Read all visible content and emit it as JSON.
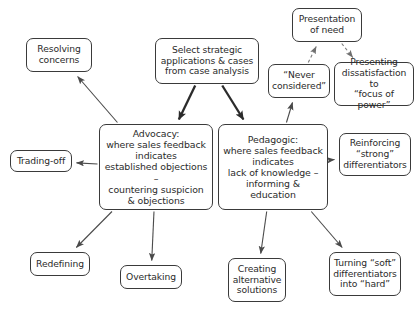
{
  "diagram": {
    "style": {
      "background": "#ffffff",
      "node_border": "#3a3a3a",
      "text_color": "#2b2b2b",
      "edge_solid": "#4a4a4a",
      "edge_thick": "#2b2b2b",
      "edge_dashed": "#7d7d7d"
    },
    "nodes": [
      {
        "id": "resolving",
        "label": "Resolving\nconcerns",
        "x": 26,
        "y": 38,
        "w": 66,
        "h": 34,
        "size": "n-small"
      },
      {
        "id": "select",
        "label": "Select strategic\napplications & cases\nfrom case analysis",
        "x": 155,
        "y": 38,
        "w": 104,
        "h": 46,
        "size": "n-mid"
      },
      {
        "id": "presentation",
        "label": "Presentation\nof need",
        "x": 292,
        "y": 8,
        "w": 70,
        "h": 34,
        "size": "n-small"
      },
      {
        "id": "never",
        "label": "“Never\nconsidered”",
        "x": 268,
        "y": 64,
        "w": 62,
        "h": 34,
        "size": "n-small"
      },
      {
        "id": "presenting",
        "label": "Presenting\ndissatisfaction to\n“focus of power”",
        "x": 334,
        "y": 62,
        "w": 80,
        "h": 44,
        "size": "n-small"
      },
      {
        "id": "advocacy",
        "label": "Advocacy:\nwhere sales feedback\nindicates\nestablished objections –\ncountering suspicion\n& objections",
        "x": 99,
        "y": 124,
        "w": 114,
        "h": 86,
        "size": "n-big"
      },
      {
        "id": "pedagogic",
        "label": "Pedagogic:\nwhere sales feedback\nindicates\nlack of knowledge –\ninforming & education",
        "x": 218,
        "y": 124,
        "w": 110,
        "h": 86,
        "size": "n-big"
      },
      {
        "id": "trading",
        "label": "Trading-off",
        "x": 10,
        "y": 150,
        "w": 62,
        "h": 22,
        "size": "n-small"
      },
      {
        "id": "reinforcing",
        "label": "Reinforcing\n“strong”\ndifferentiators",
        "x": 339,
        "y": 133,
        "w": 72,
        "h": 43,
        "size": "n-small"
      },
      {
        "id": "redefining",
        "label": "Redefining",
        "x": 30,
        "y": 252,
        "w": 60,
        "h": 24,
        "size": "n-small"
      },
      {
        "id": "overtaking",
        "label": "Overtaking",
        "x": 120,
        "y": 265,
        "w": 62,
        "h": 24,
        "size": "n-small"
      },
      {
        "id": "creating",
        "label": "Creating\nalternative\nsolutions",
        "x": 228,
        "y": 258,
        "w": 58,
        "h": 44,
        "size": "n-small"
      },
      {
        "id": "turning",
        "label": "Turning “soft”\ndifferentiators\ninto “hard”",
        "x": 329,
        "y": 252,
        "w": 72,
        "h": 44,
        "size": "n-small"
      }
    ],
    "edges": [
      {
        "id": "select-advocacy",
        "from": "select",
        "to": "advocacy",
        "style": "thick",
        "arrow": "end"
      },
      {
        "id": "select-pedagogic",
        "from": "select",
        "to": "pedagogic",
        "style": "thick",
        "arrow": "end"
      },
      {
        "id": "advocacy-resolving",
        "from": "advocacy",
        "to": "resolving",
        "style": "solid",
        "arrow": "end"
      },
      {
        "id": "advocacy-trading",
        "from": "advocacy",
        "to": "trading",
        "style": "solid",
        "arrow": "end"
      },
      {
        "id": "advocacy-redefining",
        "from": "advocacy",
        "to": "redefining",
        "style": "solid",
        "arrow": "end"
      },
      {
        "id": "advocacy-overtaking",
        "from": "advocacy",
        "to": "overtaking",
        "style": "solid",
        "arrow": "end"
      },
      {
        "id": "pedagogic-never",
        "from": "pedagogic",
        "to": "never",
        "style": "solid",
        "arrow": "end"
      },
      {
        "id": "pedagogic-reinforcing",
        "from": "pedagogic",
        "to": "reinforcing",
        "style": "solid",
        "arrow": "end"
      },
      {
        "id": "pedagogic-creating",
        "from": "pedagogic",
        "to": "creating",
        "style": "solid",
        "arrow": "end"
      },
      {
        "id": "pedagogic-turning",
        "from": "pedagogic",
        "to": "turning",
        "style": "solid",
        "arrow": "end"
      },
      {
        "id": "never-presentation",
        "from": "never",
        "to": "presentation",
        "style": "dashed",
        "arrow": "end"
      },
      {
        "id": "presentation-presenting",
        "from": "presentation",
        "to": "presenting",
        "style": "dashed",
        "arrow": "end"
      }
    ]
  }
}
